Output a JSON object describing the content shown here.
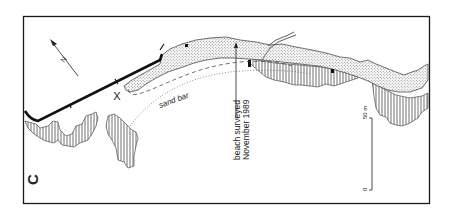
{
  "figure": {
    "panel_label": "C",
    "north_label": "N",
    "sand_bar_label": "sand bar",
    "survey_label_line1": "beach surveyed",
    "survey_label_line2": "November 1989",
    "scale": {
      "top_label": "50 m",
      "bottom_label": "0",
      "length_m": 50
    },
    "marker_label": "X",
    "colors": {
      "ink": "#1a1a1a",
      "stipple": "#b8b8b8",
      "background": "#ffffff"
    }
  }
}
